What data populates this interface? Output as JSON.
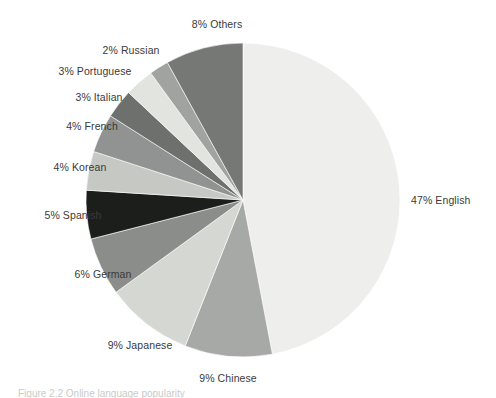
{
  "figure": {
    "caption": "Figure 2.2  Online language popularity",
    "background_color": "#ffffff",
    "label_color": "#3a3a3a"
  },
  "chart_data": {
    "type": "pie",
    "title": "",
    "xlabel": "",
    "ylabel": "",
    "units": "percent",
    "start_angle_deg": 0,
    "direction": "clockwise",
    "legend": "none",
    "grid": false,
    "categories": [
      "English",
      "Chinese",
      "Japanese",
      "German",
      "Spanish",
      "Korean",
      "French",
      "Italian",
      "Portuguese",
      "Russian",
      "Others"
    ],
    "values": [
      47,
      9,
      9,
      6,
      5,
      4,
      4,
      3,
      3,
      2,
      8
    ],
    "colors": [
      "#eeefed",
      "#a7a9a6",
      "#d5d7d3",
      "#8a8d89",
      "#1c1e1c",
      "#c6c8c4",
      "#909391",
      "#6e706d",
      "#e2e4e0",
      "#a0a3a0",
      "#757875"
    ],
    "slices": [
      {
        "label": "47% English",
        "name": "English",
        "value": 47,
        "color": "#eeefed"
      },
      {
        "label": "9% Chinese",
        "name": "Chinese",
        "value": 9,
        "color": "#a7a9a6"
      },
      {
        "label": "9% Japanese",
        "name": "Japanese",
        "value": 9,
        "color": "#d5d7d3"
      },
      {
        "label": "6% German",
        "name": "German",
        "value": 6,
        "color": "#8a8d89"
      },
      {
        "label": "5% Spanish",
        "name": "Spanish",
        "value": 5,
        "color": "#1c1e1c"
      },
      {
        "label": "4% Korean",
        "name": "Korean",
        "value": 4,
        "color": "#c6c8c4"
      },
      {
        "label": "4% French",
        "name": "French",
        "value": 4,
        "color": "#909391"
      },
      {
        "label": "3% Italian",
        "name": "Italian",
        "value": 3,
        "color": "#6e706d"
      },
      {
        "label": "3% Portuguese",
        "name": "Portuguese",
        "value": 3,
        "color": "#e2e4e0"
      },
      {
        "label": "2% Russian",
        "name": "Russian",
        "value": 2,
        "color": "#a0a3a0"
      },
      {
        "label": "8% Others",
        "name": "Others",
        "value": 8,
        "color": "#757875"
      }
    ]
  },
  "geometry": {
    "center_x": 243,
    "center_y": 200,
    "radius": 157,
    "stroke_color": "#ffffff",
    "stroke_width": 0.6
  },
  "label_positions": [
    {
      "key": "English",
      "x": 411,
      "y": 194,
      "align": "left"
    },
    {
      "key": "Chinese",
      "x": 228,
      "y": 372,
      "align": "center"
    },
    {
      "key": "Japanese",
      "x": 140,
      "y": 339,
      "align": "center"
    },
    {
      "key": "German",
      "x": 103,
      "y": 268,
      "align": "center"
    },
    {
      "key": "Spanish",
      "x": 73,
      "y": 209,
      "align": "center"
    },
    {
      "key": "Korean",
      "x": 80,
      "y": 161,
      "align": "center"
    },
    {
      "key": "French",
      "x": 92,
      "y": 120,
      "align": "center"
    },
    {
      "key": "Italian",
      "x": 99,
      "y": 91,
      "align": "center"
    },
    {
      "key": "Portuguese",
      "x": 95,
      "y": 65,
      "align": "center"
    },
    {
      "key": "Russian",
      "x": 131,
      "y": 44,
      "align": "center"
    },
    {
      "key": "Others",
      "x": 217,
      "y": 18,
      "align": "center"
    }
  ]
}
